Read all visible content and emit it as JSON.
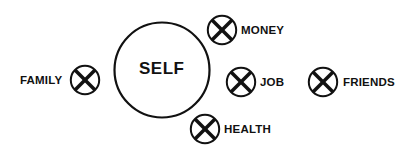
{
  "diagram": {
    "center": {
      "label": "SELF"
    },
    "nodes": [
      {
        "id": "family",
        "label": "FAMILY",
        "icon": "x-circle-icon"
      },
      {
        "id": "money",
        "label": "MONEY",
        "icon": "x-circle-icon"
      },
      {
        "id": "job",
        "label": "JOB",
        "icon": "x-circle-icon"
      },
      {
        "id": "friends",
        "label": "FRIENDS",
        "icon": "x-circle-icon"
      },
      {
        "id": "health",
        "label": "HEALTH",
        "icon": "x-circle-icon"
      }
    ],
    "colors": {
      "stroke": "#111111",
      "background": "#ffffff"
    }
  }
}
